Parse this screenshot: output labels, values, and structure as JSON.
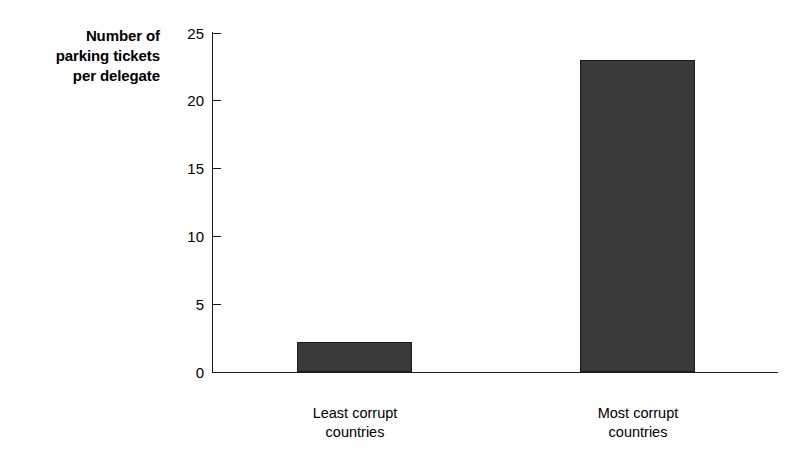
{
  "chart_data": {
    "type": "bar",
    "title": "",
    "subtitle": "",
    "xlabel": "",
    "ylabel": "Number of\nparking tickets\nper delegate",
    "categories": [
      "Least corrupt\ncountries",
      "Most corrupt\ncountries"
    ],
    "values": [
      2.2,
      23
    ],
    "ylim": [
      0,
      25
    ],
    "yticks": [
      "0",
      "5",
      "10",
      "15",
      "20",
      "25"
    ],
    "ytick_values": [
      0,
      5,
      10,
      15,
      20,
      25
    ],
    "grid": false,
    "legend": null,
    "series": [
      {
        "name": "Parking tickets per delegate",
        "values": [
          2.2,
          23
        ]
      }
    ],
    "annotations": [],
    "colors": {
      "bar_fill": "#3a3a3a",
      "bar_edge": "#1c1c1c",
      "axis": "#1a1a1a",
      "text": "#000000",
      "background": "#ffffff"
    }
  }
}
